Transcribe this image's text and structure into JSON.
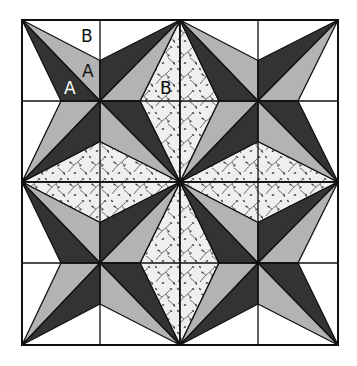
{
  "diagram": {
    "grid": {
      "rows": 4,
      "cols": 4
    },
    "blocks": {
      "rows": 2,
      "cols": 2,
      "motif": "four-point star pinwheel"
    },
    "fabrics": {
      "background": {
        "name": "white",
        "color": "#ffffff"
      },
      "light": {
        "name": "light grey",
        "color": "#b3b3b3"
      },
      "dark": {
        "name": "dark",
        "color": "#333333"
      },
      "print": {
        "name": "leaf print",
        "color": "#efefef",
        "motif_color": "#4a4a4a"
      },
      "seam": {
        "color": "#111111"
      }
    },
    "labels": [
      {
        "text": "B",
        "piece": "background",
        "fill": "#111111"
      },
      {
        "text": "A",
        "piece": "light",
        "fill": "#111111"
      },
      {
        "text": "A",
        "piece": "dark",
        "fill": "#ffffff"
      },
      {
        "text": "B",
        "piece": "print",
        "fill": "#111111"
      }
    ]
  }
}
